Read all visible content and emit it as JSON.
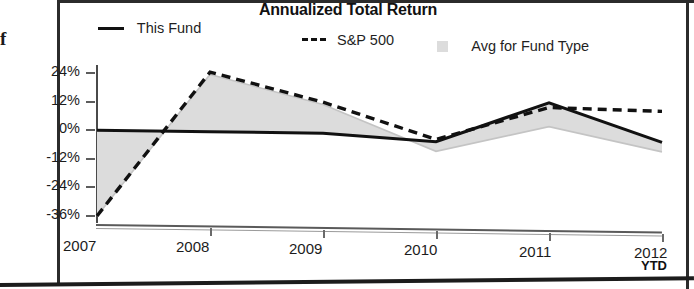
{
  "chart_data": {
    "type": "area",
    "title": "Annualized Total Return",
    "xlabel": "",
    "ylabel": "",
    "x": [
      "2007",
      "2008",
      "2009",
      "2010",
      "2011",
      "2012"
    ],
    "categories": [
      "2007",
      "2008",
      "2009",
      "2010",
      "2011",
      "2012"
    ],
    "ylim": [
      -36,
      24
    ],
    "yticks": [
      24,
      12,
      0,
      -12,
      -24,
      -36
    ],
    "ytick_labels": [
      "24%",
      "12%",
      "0%",
      "-12%",
      "-24%",
      "-36%"
    ],
    "grid": false,
    "legend_position": "top",
    "x_axis_note": "YTD",
    "series": [
      {
        "name": "This Fund",
        "style": "solid",
        "color": "#111111",
        "values": [
          0,
          0,
          0,
          -3,
          14,
          -2
        ]
      },
      {
        "name": "S&P 500",
        "style": "dashed",
        "color": "#111111",
        "values": [
          -36,
          25,
          13,
          -2,
          12,
          11
        ]
      },
      {
        "name": "Avg for Fund Type",
        "style": "area",
        "color": "#dcdcdc",
        "values": [
          -36,
          24,
          12,
          -7,
          4,
          -6
        ]
      }
    ]
  },
  "chart": {
    "title": "Annualized Total Return",
    "ytd_label": "YTD",
    "clipped_margin_char": "f",
    "y_axis": {
      "labels": [
        "24%",
        "12%",
        "0%",
        "-12%",
        "-24%",
        "-36%"
      ]
    },
    "x_axis": {
      "labels": [
        "2007",
        "2008",
        "2009",
        "2010",
        "2011",
        "2012"
      ]
    },
    "legend": [
      {
        "label": "This Fund",
        "swatch": "solid-line-swatch",
        "color": "#111111"
      },
      {
        "label": "S&P 500",
        "swatch": "dashed-line-swatch",
        "color": "#111111"
      },
      {
        "label": "Avg for Fund Type",
        "swatch": "gray-box-swatch",
        "color": "#dcdcdc"
      }
    ]
  }
}
